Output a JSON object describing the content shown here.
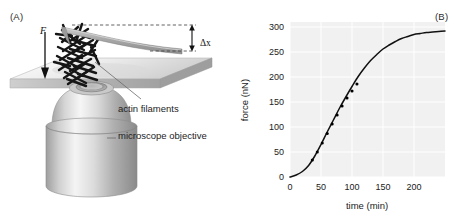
{
  "figure": {
    "panel_a": {
      "label": "(A)",
      "force_symbol": "F",
      "displacement_symbol": "Δx",
      "annotations": {
        "actin": "actin filaments",
        "objective": "microscope objective"
      },
      "icons": {
        "force_arrow": "down-arrow-icon",
        "displacement_arrow": "double-headed-vertical-arrow-icon",
        "cantilever": "cantilever-beam-icon",
        "objective": "microscope-objective-icon",
        "slide": "glass-slide-icon",
        "filaments": "actin-filament-bundle-icon"
      }
    },
    "panel_b": {
      "label": "(B)"
    }
  },
  "chart_data": {
    "type": "line",
    "title": "",
    "xlabel": "time (min)",
    "ylabel": "force (nN)",
    "xlim": [
      0,
      250
    ],
    "ylim": [
      0,
      310
    ],
    "xticks": [
      0,
      50,
      100,
      150,
      200
    ],
    "yticks": [
      0,
      50,
      100,
      150,
      200,
      250,
      300
    ],
    "grid": true,
    "grid_color": "#ffffff",
    "plot_background": "#f1f1f1",
    "line_color": "#111111",
    "marker_color": "#000000",
    "legend": null,
    "series": [
      {
        "name": "force",
        "x": [
          0,
          10,
          20,
          30,
          40,
          50,
          60,
          70,
          80,
          90,
          100,
          110,
          120,
          130,
          140,
          150,
          160,
          170,
          180,
          190,
          200,
          210,
          220,
          230,
          240,
          250
        ],
        "y": [
          0,
          4,
          11,
          23,
          42,
          65,
          90,
          114,
          138,
          160,
          181,
          201,
          218,
          233,
          245,
          256,
          264,
          271,
          277,
          281,
          285,
          287,
          289,
          290,
          291,
          292
        ]
      }
    ],
    "markers": {
      "x": [
        36,
        44,
        52,
        60,
        68,
        76,
        84,
        92,
        100,
        108
      ],
      "y": [
        34,
        50,
        68,
        87,
        106,
        124,
        142,
        158,
        172,
        186
      ]
    }
  }
}
